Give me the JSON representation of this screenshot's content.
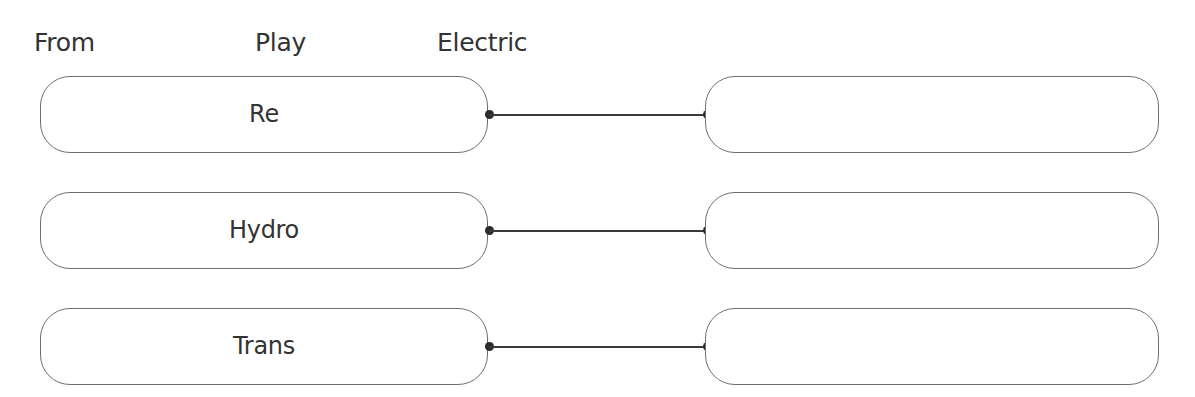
{
  "header": {
    "words": [
      "From",
      "Play",
      "Electric"
    ]
  },
  "rows": [
    {
      "left_label": "Re",
      "right_label": ""
    },
    {
      "left_label": "Hydro",
      "right_label": ""
    },
    {
      "left_label": "Trans",
      "right_label": ""
    }
  ],
  "colors": {
    "text": "#333333",
    "box_border": "#6f6f6f",
    "connector": "#3a3a3a",
    "background": "#ffffff"
  }
}
